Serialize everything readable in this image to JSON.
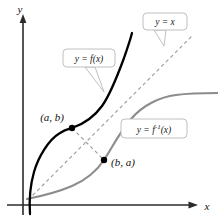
{
  "figure": {
    "kind": "inverse-function-reflection-diagram",
    "background_color": "#ffffff",
    "axes": {
      "x_label": "x",
      "y_label": "y",
      "axis_color": "#2b2b2b"
    },
    "curves": {
      "function": {
        "name": "f",
        "color": "#000000",
        "label": "y = f(x)"
      },
      "inverse": {
        "name": "f-inverse",
        "color": "#8c8c8c",
        "label_prefix": "y = f",
        "label_exponent": "-1",
        "label_suffix": "(x)"
      },
      "identity": {
        "name": "identity-line",
        "color": "#9a9a9a",
        "label": "y = x",
        "style": "dashed"
      },
      "reflection_segment": {
        "color": "#9a9a9a",
        "style": "dashed"
      }
    },
    "points": [
      {
        "id": "point-ab",
        "label": "(a, b)",
        "on": "function",
        "color": "#000000"
      },
      {
        "id": "point-ba",
        "label": "(b, a)",
        "on": "inverse",
        "color": "#000000"
      }
    ],
    "callouts": [
      {
        "id": "callout-identity",
        "text": "y = x"
      },
      {
        "id": "callout-function",
        "text": "y = f(x)"
      },
      {
        "id": "callout-inverse",
        "text": "y = f⁻¹(x)"
      }
    ]
  }
}
